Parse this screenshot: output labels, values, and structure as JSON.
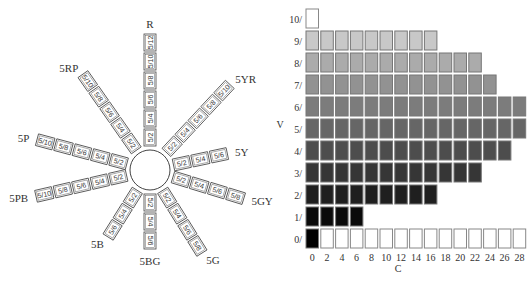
{
  "hue_wheel": {
    "title": "Munsell hue circle at value 5",
    "spokes": [
      {
        "hue": "R",
        "chips": [
          "5/2",
          "5/4",
          "5/6",
          "5/8",
          "5/10",
          "5/12"
        ]
      },
      {
        "hue": "5YR",
        "chips": [
          "5/2",
          "5/4",
          "5/6",
          "5/8",
          "5/10"
        ]
      },
      {
        "hue": "5Y",
        "chips": [
          "5/2",
          "5/4",
          "5/6"
        ]
      },
      {
        "hue": "5GY",
        "chips": [
          "5/2",
          "5/4",
          "5/6",
          "5/8"
        ]
      },
      {
        "hue": "5G",
        "chips": [
          "5/2",
          "5/4",
          "5/6",
          "5/8"
        ]
      },
      {
        "hue": "5BG",
        "chips": [
          "5/2",
          "5/4",
          "5/6"
        ]
      },
      {
        "hue": "5B",
        "chips": [
          "5/2",
          "5/4",
          "5/6"
        ]
      },
      {
        "hue": "5PB",
        "chips": [
          "5/2",
          "5/4",
          "5/6",
          "5/8",
          "5/10"
        ]
      },
      {
        "hue": "5P",
        "chips": [
          "5/2",
          "5/4",
          "5/6",
          "5/8",
          "5/10"
        ]
      },
      {
        "hue": "5RP",
        "chips": [
          "5/2",
          "5/4",
          "5/6",
          "5/8",
          "5/10"
        ]
      }
    ]
  },
  "value_chroma_chart": {
    "y_axis_title": "V",
    "x_axis_title": "C",
    "x_ticks": [
      "0",
      "2",
      "4",
      "6",
      "8",
      "10",
      "12",
      "14",
      "16",
      "18",
      "20",
      "22",
      "24",
      "26",
      "28"
    ],
    "rows": [
      {
        "label": "10/",
        "value": 10,
        "max_chroma": 0,
        "gray": "#ffffff"
      },
      {
        "label": "9/",
        "value": 9,
        "max_chroma": 16,
        "gray": "#c8c8c8"
      },
      {
        "label": "8/",
        "value": 8,
        "max_chroma": 22,
        "gray": "#ababab"
      },
      {
        "label": "7/",
        "value": 7,
        "max_chroma": 24,
        "gray": "#929292"
      },
      {
        "label": "6/",
        "value": 6,
        "max_chroma": 28,
        "gray": "#7c7c7c"
      },
      {
        "label": "5/",
        "value": 5,
        "max_chroma": 28,
        "gray": "#666666"
      },
      {
        "label": "4/",
        "value": 4,
        "max_chroma": 26,
        "gray": "#4d4d4d"
      },
      {
        "label": "3/",
        "value": 3,
        "max_chroma": 22,
        "gray": "#363636"
      },
      {
        "label": "2/",
        "value": 2,
        "max_chroma": 16,
        "gray": "#1f1f1f"
      },
      {
        "label": "1/",
        "value": 1,
        "max_chroma": 6,
        "gray": "#0a0a0a"
      },
      {
        "label": "0/",
        "value": 0,
        "max_chroma": 28,
        "gray": "#000000",
        "outline_only_after_first": true
      }
    ]
  },
  "chart_data": {
    "type": "heatmap",
    "title": "",
    "xlabel": "C",
    "ylabel": "V",
    "x": [
      0,
      2,
      4,
      6,
      8,
      10,
      12,
      14,
      16,
      18,
      20,
      22,
      24,
      26,
      28
    ],
    "y": [
      10,
      9,
      8,
      7,
      6,
      5,
      4,
      3,
      2,
      1,
      0
    ],
    "max_chroma_by_value": {
      "10": 0,
      "9": 16,
      "8": 22,
      "7": 24,
      "6": 28,
      "5": 28,
      "4": 26,
      "3": 22,
      "2": 16,
      "1": 6,
      "0": 0
    },
    "xlim": [
      0,
      28
    ],
    "ylim": [
      0,
      10
    ]
  }
}
